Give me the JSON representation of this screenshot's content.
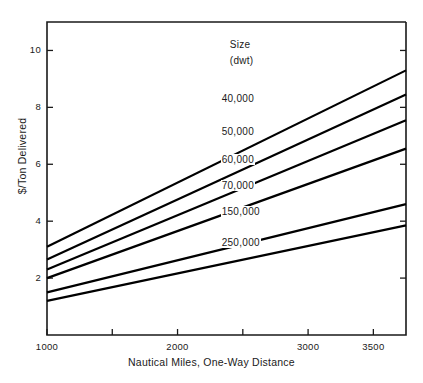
{
  "chart_data": {
    "type": "line",
    "title": "",
    "xlabel": "Nautical Miles, One-Way Distance",
    "ylabel": "$/Ton Delivered",
    "xlim": [
      1000,
      3750
    ],
    "ylim": [
      0,
      11
    ],
    "grid": false,
    "legend_position": "inline-right",
    "legend_title": "Size",
    "legend_subtitle": "(dwt)",
    "xticks": [
      1000,
      1500,
      2000,
      2500,
      3000,
      3500
    ],
    "xtick_labels": [
      "1000",
      "",
      "2000",
      "",
      "3000",
      "3500"
    ],
    "yticks": [
      2,
      4,
      6,
      8,
      10
    ],
    "ytick_labels": [
      "2",
      "4",
      "6",
      "8",
      "10"
    ],
    "x": [
      1000,
      3750
    ],
    "series": [
      {
        "name": "40,000",
        "values": [
          3.1,
          9.3
        ],
        "label_x": 2330,
        "label_y": 8.25
      },
      {
        "name": "50,000",
        "values": [
          2.65,
          8.45
        ],
        "label_x": 2330,
        "label_y": 7.1
      },
      {
        "name": "60,000",
        "values": [
          2.3,
          7.55
        ],
        "label_x": 2330,
        "label_y": 6.1
      },
      {
        "name": "70,000",
        "values": [
          2.0,
          6.55
        ],
        "label_x": 2330,
        "label_y": 5.2
      },
      {
        "name": "150,000",
        "values": [
          1.5,
          4.6
        ],
        "label_x": 2330,
        "label_y": 4.3
      },
      {
        "name": "250,000",
        "values": [
          1.2,
          3.85
        ],
        "label_x": 2330,
        "label_y": 3.2
      }
    ]
  },
  "axes": {
    "x_title": "Nautical Miles, One-Way Distance",
    "y_title": "$/Ton Delivered"
  },
  "legend": {
    "heading": "Size",
    "subheading": "(dwt)"
  },
  "colors": {
    "line": "#000000",
    "axis": "#1a1a1a",
    "background": "#ffffff"
  }
}
